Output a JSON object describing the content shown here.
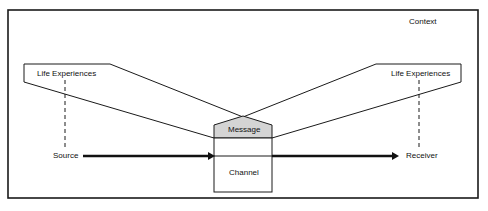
{
  "diagram": {
    "context_label": "Context",
    "left_life_experiences": "Life Experiences",
    "right_life_experiences": "Life Experiences",
    "source_label": "Source",
    "receiver_label": "Receiver",
    "message_label": "Message",
    "channel_label": "Channel",
    "colors": {
      "line": "#1a1a1a",
      "message_fill": "#d4d4d4",
      "background": "#ffffff"
    }
  }
}
